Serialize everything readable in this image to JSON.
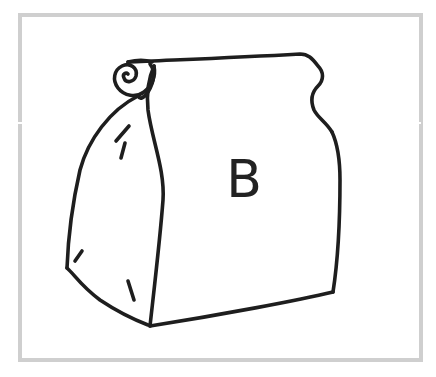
{
  "figure": {
    "label": "B",
    "colors": {
      "frame": "#cfcfcf",
      "stroke": "#1e1e1e",
      "background": "#ffffff"
    }
  }
}
